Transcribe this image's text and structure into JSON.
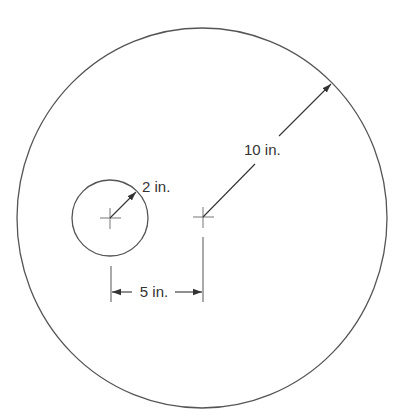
{
  "diagram": {
    "type": "geometry-dimensioned-circles",
    "colors": {
      "stroke": "#555555",
      "text": "#333333",
      "background": "#ffffff"
    },
    "outer_circle": {
      "radius_label": "10 in.",
      "radius_value": 10,
      "unit": "in."
    },
    "inner_circle": {
      "radius_label": "2 in.",
      "radius_value": 2,
      "unit": "in."
    },
    "center_distance": {
      "label": "5 in.",
      "value": 5,
      "unit": "in."
    }
  }
}
